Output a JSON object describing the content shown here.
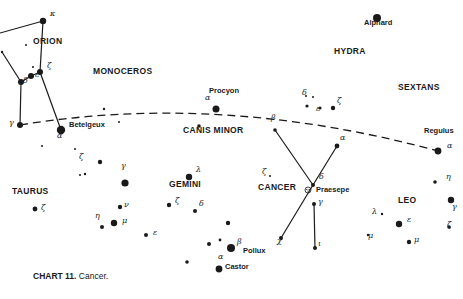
{
  "caption": {
    "bold": "CHART 11.",
    "text": " Cancer."
  },
  "colors": {
    "ink": "#1a1a1a",
    "background": "#ffffff"
  },
  "constellations": [
    {
      "id": "orion",
      "label": "ORION",
      "x": 33,
      "y": 42
    },
    {
      "id": "monoceros",
      "label": "MONOCEROS",
      "x": 93,
      "y": 72
    },
    {
      "id": "hydra",
      "label": "HYDRA",
      "x": 334,
      "y": 52
    },
    {
      "id": "sextans",
      "label": "SEXTANS",
      "x": 398,
      "y": 88
    },
    {
      "id": "canis-minor",
      "label": "CANIS  MINOR",
      "x": 183,
      "y": 131
    },
    {
      "id": "taurus",
      "label": "TAURUS",
      "x": 12,
      "y": 192
    },
    {
      "id": "gemini",
      "label": "GEMINI",
      "x": 169,
      "y": 185
    },
    {
      "id": "cancer",
      "label": "CANCER",
      "x": 258,
      "y": 188
    },
    {
      "id": "leo",
      "label": "LEO",
      "x": 398,
      "y": 201
    }
  ],
  "named_stars": [
    {
      "id": "betelgeuse",
      "label": "Betelgeux",
      "x": 69,
      "y": 126
    },
    {
      "id": "procyon",
      "label": "Procyon",
      "x": 209,
      "y": 92
    },
    {
      "id": "alphard",
      "label": "Alphard",
      "x": 364,
      "y": 24
    },
    {
      "id": "regulus",
      "label": "Regulus",
      "x": 424,
      "y": 132
    },
    {
      "id": "praesepe",
      "label": "Praesepe",
      "x": 316,
      "y": 191
    },
    {
      "id": "pollux",
      "label": "Pollux",
      "x": 243,
      "y": 252
    },
    {
      "id": "castor",
      "label": "Castor",
      "x": 225,
      "y": 268
    }
  ],
  "greek_labels": [
    {
      "t": "κ",
      "x": 50,
      "y": 15
    },
    {
      "t": "ζ",
      "x": 47,
      "y": 67
    },
    {
      "t": "ε",
      "x": 35,
      "y": 76
    },
    {
      "t": "δ",
      "x": 23,
      "y": 82
    },
    {
      "t": "γ",
      "x": 9,
      "y": 124
    },
    {
      "t": "α",
      "x": 57,
      "y": 137
    },
    {
      "t": "α",
      "x": 205,
      "y": 99
    },
    {
      "t": "β",
      "x": 271,
      "y": 119
    },
    {
      "t": "δ",
      "x": 302,
      "y": 94
    },
    {
      "t": "ε",
      "x": 316,
      "y": 110
    },
    {
      "t": "ζ",
      "x": 337,
      "y": 102
    },
    {
      "t": "α",
      "x": 340,
      "y": 139
    },
    {
      "t": "α",
      "x": 447,
      "y": 147
    },
    {
      "t": "ζ",
      "x": 79,
      "y": 158
    },
    {
      "t": "γ",
      "x": 121,
      "y": 167
    },
    {
      "t": "λ",
      "x": 196,
      "y": 171
    },
    {
      "t": "ζ",
      "x": 175,
      "y": 202
    },
    {
      "t": "δ",
      "x": 199,
      "y": 205
    },
    {
      "t": "ν",
      "x": 124,
      "y": 206
    },
    {
      "t": "η",
      "x": 95,
      "y": 217
    },
    {
      "t": "μ",
      "x": 122,
      "y": 222
    },
    {
      "t": "ε",
      "x": 153,
      "y": 234
    },
    {
      "t": "ζ",
      "x": 41,
      "y": 209
    },
    {
      "t": "β",
      "x": 237,
      "y": 243
    },
    {
      "t": "α",
      "x": 218,
      "y": 258
    },
    {
      "t": "ζ",
      "x": 262,
      "y": 173
    },
    {
      "t": "δ",
      "x": 319,
      "y": 178
    },
    {
      "t": "γ",
      "x": 318,
      "y": 203
    },
    {
      "t": "χ",
      "x": 277,
      "y": 242
    },
    {
      "t": "ι",
      "x": 318,
      "y": 245
    },
    {
      "t": "η",
      "x": 446,
      "y": 178
    },
    {
      "t": "γ",
      "x": 452,
      "y": 208
    },
    {
      "t": "λ",
      "x": 372,
      "y": 213
    },
    {
      "t": "ε",
      "x": 407,
      "y": 221
    },
    {
      "t": "μ",
      "x": 368,
      "y": 237
    },
    {
      "t": "ζ",
      "x": 447,
      "y": 226
    },
    {
      "t": "μ",
      "x": 414,
      "y": 241
    }
  ],
  "stars": [
    {
      "x": 43,
      "y": 21,
      "r": 3.2
    },
    {
      "x": 26,
      "y": 45,
      "r": 1
    },
    {
      "x": 40,
      "y": 72,
      "r": 3
    },
    {
      "x": 31,
      "y": 76,
      "r": 3
    },
    {
      "x": 33,
      "y": 67,
      "r": 1
    },
    {
      "x": 21,
      "y": 82,
      "r": 3
    },
    {
      "x": 20,
      "y": 125,
      "r": 3
    },
    {
      "x": 61,
      "y": 130,
      "r": 4.2
    },
    {
      "x": 2,
      "y": 52,
      "r": 1.2
    },
    {
      "x": 104,
      "y": 109,
      "r": 1.2
    },
    {
      "x": 119,
      "y": 122,
      "r": 1
    },
    {
      "x": 75,
      "y": 149,
      "r": 1
    },
    {
      "x": 216,
      "y": 109,
      "r": 3.5
    },
    {
      "x": 199,
      "y": 126,
      "r": 1.8
    },
    {
      "x": 377,
      "y": 18,
      "r": 4
    },
    {
      "x": 306,
      "y": 96,
      "r": 1
    },
    {
      "x": 313,
      "y": 97,
      "r": 1
    },
    {
      "x": 307,
      "y": 106,
      "r": 1.6
    },
    {
      "x": 320,
      "y": 108,
      "r": 1.6
    },
    {
      "x": 333,
      "y": 108,
      "r": 2.2
    },
    {
      "x": 275,
      "y": 130,
      "r": 1.8
    },
    {
      "x": 337,
      "y": 146,
      "r": 2.4
    },
    {
      "x": 438,
      "y": 151,
      "r": 3.4
    },
    {
      "x": 435,
      "y": 182,
      "r": 1.8
    },
    {
      "x": 451,
      "y": 200,
      "r": 3.2
    },
    {
      "x": 449,
      "y": 227,
      "r": 1.8
    },
    {
      "x": 100,
      "y": 162,
      "r": 2.2
    },
    {
      "x": 85,
      "y": 174,
      "r": 1.2
    },
    {
      "x": 80,
      "y": 175,
      "r": 1
    },
    {
      "x": 125,
      "y": 183,
      "r": 3.6
    },
    {
      "x": 120,
      "y": 207,
      "r": 2.2
    },
    {
      "x": 114,
      "y": 223,
      "r": 3.2
    },
    {
      "x": 102,
      "y": 227,
      "r": 2
    },
    {
      "x": 146,
      "y": 235,
      "r": 2
    },
    {
      "x": 35,
      "y": 209,
      "r": 2.4
    },
    {
      "x": 189,
      "y": 177,
      "r": 3.2
    },
    {
      "x": 169,
      "y": 205,
      "r": 2.2
    },
    {
      "x": 195,
      "y": 211,
      "r": 2
    },
    {
      "x": 228,
      "y": 223,
      "r": 2.2
    },
    {
      "x": 209,
      "y": 244,
      "r": 2
    },
    {
      "x": 220,
      "y": 240,
      "r": 1.4
    },
    {
      "x": 231,
      "y": 248,
      "r": 4
    },
    {
      "x": 187,
      "y": 262,
      "r": 1.8
    },
    {
      "x": 219,
      "y": 269,
      "r": 3.4
    },
    {
      "x": 270,
      "y": 176,
      "r": 1
    },
    {
      "x": 313,
      "y": 185,
      "r": 2
    },
    {
      "x": 314,
      "y": 204,
      "r": 2
    },
    {
      "x": 281,
      "y": 238,
      "r": 2
    },
    {
      "x": 315,
      "y": 248,
      "r": 2
    },
    {
      "x": 382,
      "y": 214,
      "r": 1.2
    },
    {
      "x": 399,
      "y": 224,
      "r": 3.2
    },
    {
      "x": 409,
      "y": 242,
      "r": 2.2
    },
    {
      "x": 368,
      "y": 235,
      "r": 1.2
    },
    {
      "x": 42,
      "y": 146,
      "r": 1
    }
  ],
  "lines": [
    [
      [
        0,
        33
      ],
      [
        43,
        21
      ]
    ],
    [
      [
        43,
        21
      ],
      [
        40,
        72
      ]
    ],
    [
      [
        40,
        72
      ],
      [
        61,
        130
      ]
    ],
    [
      [
        40,
        72
      ],
      [
        31,
        76
      ]
    ],
    [
      [
        31,
        76
      ],
      [
        21,
        82
      ]
    ],
    [
      [
        21,
        82
      ],
      [
        20,
        125
      ]
    ],
    [
      [
        2,
        52
      ],
      [
        21,
        82
      ]
    ],
    [
      [
        275,
        130
      ],
      [
        313,
        185
      ]
    ],
    [
      [
        337,
        146
      ],
      [
        313,
        185
      ]
    ],
    [
      [
        313,
        185
      ],
      [
        281,
        238
      ]
    ],
    [
      [
        314,
        204
      ],
      [
        315,
        248
      ]
    ]
  ],
  "praesepe_symbol": {
    "x": 308,
    "y": 190
  },
  "ecliptic": {
    "d": "M 20 125 Q 220 92 438 151"
  }
}
